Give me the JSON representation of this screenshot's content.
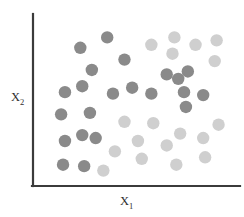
{
  "chart_data": {
    "type": "scatter",
    "title": "",
    "xlabel": "X",
    "xlabel_sub": "1",
    "ylabel": "X",
    "ylabel_sub": "2",
    "xlabel_full": "X₁",
    "ylabel_full": "X₂",
    "grid": false,
    "legend": "none",
    "xlim": [
      0,
      100
    ],
    "ylim": [
      0,
      100
    ],
    "axis_color": "#3b3b3b",
    "background": "#ffffff",
    "point_radius": 6.2,
    "series": [
      {
        "name": "class-dark",
        "color": "#8a8a8a",
        "marker": "circle",
        "points": [
          [
            13,
            58
          ],
          [
            21,
            88
          ],
          [
            27,
            73
          ],
          [
            35,
            95
          ],
          [
            22,
            62
          ],
          [
            11,
            43
          ],
          [
            26,
            44
          ],
          [
            13,
            25
          ],
          [
            22,
            29
          ],
          [
            29,
            27
          ],
          [
            12,
            9
          ],
          [
            23,
            8
          ],
          [
            38,
            57
          ],
          [
            44,
            80
          ],
          [
            48,
            61
          ],
          [
            58,
            57
          ],
          [
            66,
            70
          ],
          [
            72,
            67
          ],
          [
            77,
            72
          ],
          [
            75,
            58
          ],
          [
            85,
            56
          ],
          [
            76,
            48
          ]
        ]
      },
      {
        "name": "class-light",
        "color": "#cfcfcf",
        "marker": "circle",
        "points": [
          [
            58,
            90
          ],
          [
            69,
            84
          ],
          [
            70,
            95
          ],
          [
            81,
            90
          ],
          [
            92,
            93
          ],
          [
            91,
            79
          ],
          [
            44,
            38
          ],
          [
            59,
            37
          ],
          [
            93,
            36
          ],
          [
            73,
            30
          ],
          [
            85,
            27
          ],
          [
            66,
            22
          ],
          [
            51,
            25
          ],
          [
            39,
            18
          ],
          [
            53,
            13
          ],
          [
            71,
            9
          ],
          [
            86,
            14
          ],
          [
            33,
            5
          ]
        ]
      }
    ]
  }
}
